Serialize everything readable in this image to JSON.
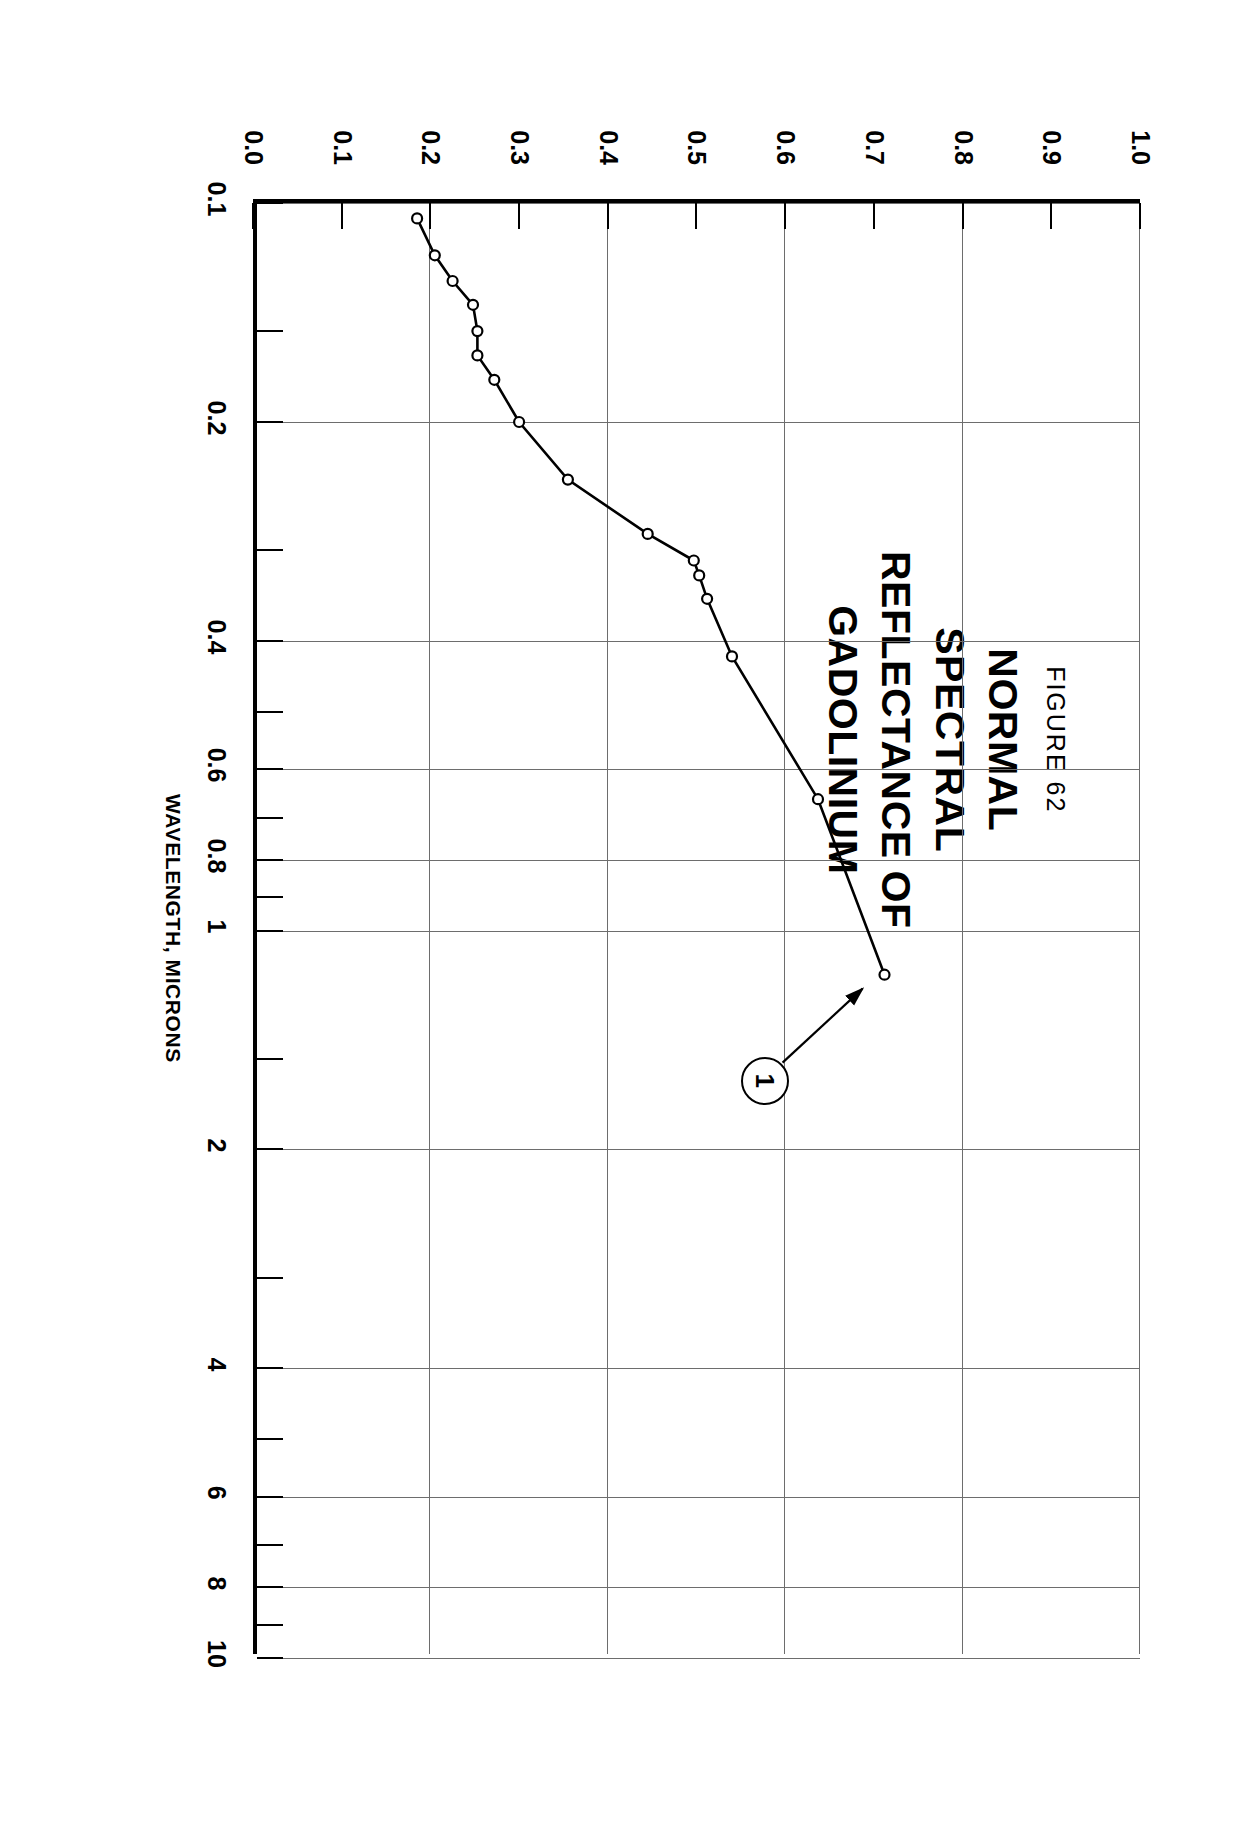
{
  "figure": {
    "number_label": "FIGURE 62",
    "title_lines": [
      "NORMAL",
      "SPECTRAL",
      "REFLECTANCE OF",
      "GADOLINIUM"
    ],
    "curve_label": "1"
  },
  "chart_data": {
    "type": "line",
    "title": "NORMAL SPECTRAL REFLECTANCE OF GADOLINIUM",
    "subtitle": "FIGURE 62",
    "xlabel": "WAVELENGTH, MICRONS",
    "ylabel": "NORMAL SPECTRAL REFLECTANCE",
    "xscale": "log",
    "xlim": [
      0.1,
      10
    ],
    "ylim": [
      0.0,
      1.0
    ],
    "grid": true,
    "legend": "none",
    "x_ticks_major": [
      "0.1",
      "0.2",
      "0.4",
      "0.6",
      "0.8",
      "1",
      "2",
      "4",
      "6",
      "8",
      "10"
    ],
    "x_ticks_minor": [
      "0.15",
      "0.3",
      "0.5",
      "0.7",
      "0.9",
      "1.5",
      "3",
      "5",
      "7",
      "9"
    ],
    "y_ticks": [
      "0.0",
      "0.1",
      "0.2",
      "0.3",
      "0.4",
      "0.5",
      "0.6",
      "0.7",
      "0.8",
      "0.9",
      "1.0"
    ],
    "annotations": [
      {
        "text": "1",
        "style": "circled",
        "points_to_series": "Curve 1"
      }
    ],
    "series": [
      {
        "name": "Curve 1",
        "marker": "open-circle",
        "points": [
          {
            "x": 0.105,
            "y": 0.185
          },
          {
            "x": 0.118,
            "y": 0.205
          },
          {
            "x": 0.128,
            "y": 0.225
          },
          {
            "x": 0.138,
            "y": 0.248
          },
          {
            "x": 0.15,
            "y": 0.253
          },
          {
            "x": 0.162,
            "y": 0.253
          },
          {
            "x": 0.175,
            "y": 0.272
          },
          {
            "x": 0.2,
            "y": 0.3
          },
          {
            "x": 0.24,
            "y": 0.355
          },
          {
            "x": 0.285,
            "y": 0.445
          },
          {
            "x": 0.31,
            "y": 0.497
          },
          {
            "x": 0.325,
            "y": 0.503
          },
          {
            "x": 0.35,
            "y": 0.512
          },
          {
            "x": 0.42,
            "y": 0.54
          },
          {
            "x": 0.66,
            "y": 0.637
          },
          {
            "x": 1.15,
            "y": 0.712
          }
        ]
      }
    ]
  },
  "axes": {
    "x_title": "WAVELENGTH, MICRONS",
    "y_title": "NORMAL SPECTRAL REFLECTANCE"
  }
}
